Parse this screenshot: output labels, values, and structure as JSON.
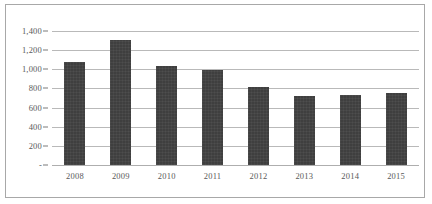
{
  "chart_data": {
    "type": "bar",
    "title": "",
    "xlabel": "",
    "ylabel": "",
    "categories": [
      "2008",
      "2009",
      "2010",
      "2011",
      "2012",
      "2013",
      "2014",
      "2015"
    ],
    "values": [
      1078,
      1309,
      1036,
      995,
      817,
      723,
      733,
      754
    ],
    "ylim": [
      0,
      1400
    ],
    "ytick_values": [
      1400,
      1200,
      1000,
      800,
      600,
      400,
      200,
      0
    ],
    "ytick_labels": [
      "1,400",
      "1,200",
      "1,000",
      "800",
      "600",
      "400",
      "200",
      "-"
    ],
    "grid": true,
    "legend": "none",
    "series": [
      {
        "name": "",
        "values": [
          1078,
          1309,
          1036,
          995,
          817,
          723,
          733,
          754
        ]
      }
    ],
    "colors": {
      "bar": "#3f3f3f",
      "gridline": "#b9b9b9",
      "axis_text": "#595959",
      "frame_border": "#a8a8a8",
      "background": "#ffffff"
    }
  }
}
